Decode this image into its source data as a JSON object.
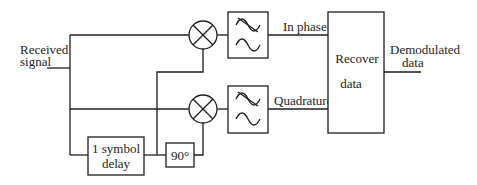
{
  "diagram": {
    "type": "block-diagram",
    "input": {
      "label_line1": "Received",
      "label_line2": "signal"
    },
    "output": {
      "label_line1": "Demodulated",
      "label_line2": "data"
    },
    "blocks": {
      "delay": {
        "line1": "1 symbol",
        "line2": "delay"
      },
      "phase_shift": {
        "label": "90°"
      },
      "recover": {
        "line1": "Recover",
        "line2": "data"
      },
      "mixer_top": {
        "symbol": "×"
      },
      "mixer_bottom": {
        "symbol": "×"
      },
      "lowpass_top": {
        "icon": "low-pass-filter"
      },
      "lowpass_bottom": {
        "icon": "low-pass-filter"
      }
    },
    "signals": {
      "in_phase": "In phase",
      "quadrature": "Quadrature"
    }
  }
}
